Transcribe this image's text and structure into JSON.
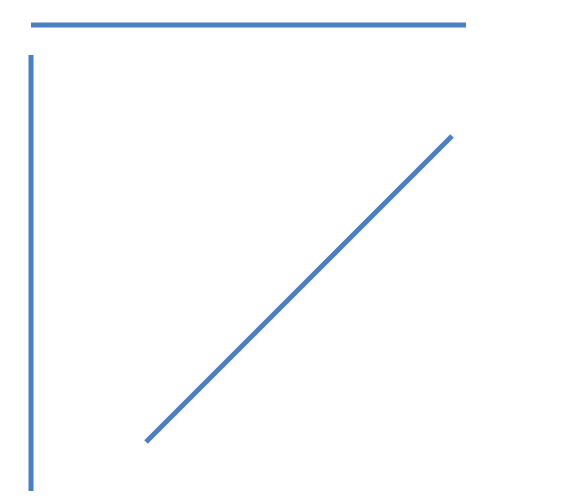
{
  "canvas": {
    "width": 563,
    "height": 502,
    "background": "#ffffff"
  },
  "stroke": {
    "color": "#4a7fc8",
    "width": 5
  },
  "lines": [
    {
      "name": "horizontal-line",
      "x1": 31,
      "y1": 25,
      "x2": 466,
      "y2": 25
    },
    {
      "name": "vertical-line",
      "x1": 31,
      "y1": 55,
      "x2": 31,
      "y2": 491
    },
    {
      "name": "diagonal-line",
      "x1": 146,
      "y1": 442,
      "x2": 452,
      "y2": 136
    }
  ]
}
